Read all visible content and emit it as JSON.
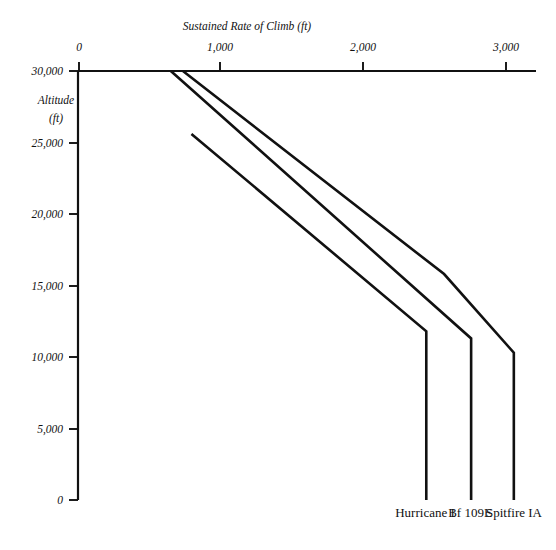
{
  "chart_data": {
    "type": "line",
    "title": "Sustained Rate of Climb (ft)",
    "xlabel": "Sustained Rate of Climb (ft)",
    "ylabel": "Altitude",
    "ylabel_units": "(ft)",
    "xlim": [
      0,
      3200
    ],
    "ylim": [
      0,
      30000
    ],
    "x_axis_position": "top",
    "grid": false,
    "legend_position": "bottom-inline",
    "x_ticks": [
      0,
      1000,
      2000,
      3000
    ],
    "x_tick_labels": [
      "0",
      "1,000",
      "2,000",
      "3,000"
    ],
    "y_ticks": [
      0,
      5000,
      10000,
      15000,
      20000,
      25000,
      30000
    ],
    "y_tick_labels": [
      "0",
      "5,000",
      "10,000",
      "15,000",
      "20,000",
      "25,000",
      "30,000"
    ],
    "note": "x = sustained rate of climb (ft/min), y = altitude (ft). Each series is plotted as rate vs altitude; below its full-throttle height each aircraft holds a constant rate down to sea level.",
    "series": [
      {
        "name": "Hurricane I",
        "label": "Hurricane I",
        "points": [
          {
            "rate": 790,
            "altitude": 25600
          },
          {
            "rate": 2440,
            "altitude": 11800
          },
          {
            "rate": 2440,
            "altitude": 0
          }
        ]
      },
      {
        "name": "Bf 109E",
        "label": "Bf 109E",
        "points": [
          {
            "rate": 645,
            "altitude": 30000
          },
          {
            "rate": 2755,
            "altitude": 11300
          },
          {
            "rate": 2755,
            "altitude": 0
          }
        ]
      },
      {
        "name": "Spitfire IA",
        "label": "Spitfire IA",
        "points": [
          {
            "rate": 730,
            "altitude": 30000
          },
          {
            "rate": 2565,
            "altitude": 15800
          },
          {
            "rate": 3055,
            "altitude": 10300
          },
          {
            "rate": 3055,
            "altitude": 0
          }
        ]
      }
    ],
    "colors": {
      "background": "#ffffff",
      "ink": "#111111"
    }
  },
  "axis": {
    "x_title": "Sustained Rate of Climb (ft)",
    "y_title_line1": "Altitude",
    "y_title_line2": "(ft)"
  },
  "labels": {
    "hurricane": "Hurricane I",
    "bf109e": "Bf 109E",
    "spitfire": "Spitfire IA"
  },
  "x_ticks": [
    {
      "label": "0"
    },
    {
      "label": "1,000"
    },
    {
      "label": "2,000"
    },
    {
      "label": "3,000"
    }
  ],
  "y_ticks": [
    {
      "label": "30,000"
    },
    {
      "label": "25,000"
    },
    {
      "label": "20,000"
    },
    {
      "label": "15,000"
    },
    {
      "label": "10,000"
    },
    {
      "label": "5,000"
    },
    {
      "label": "0"
    }
  ]
}
